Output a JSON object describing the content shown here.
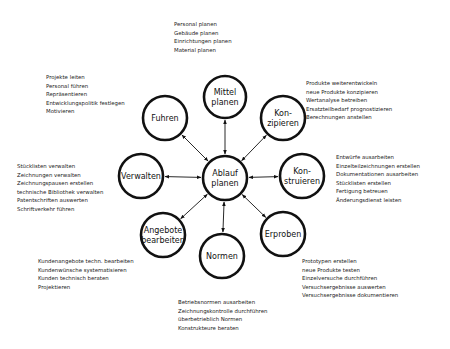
{
  "center": {
    "line1": "Ablauf",
    "line2": "planen",
    "x": 225,
    "y": 178,
    "r": 22
  },
  "nodes": [
    {
      "id": "mittel",
      "line1": "Mittel",
      "line2": "planen",
      "x": 225,
      "y": 97,
      "r": 21
    },
    {
      "id": "konzipieren",
      "line1": "Kon-",
      "line2": "zipieren",
      "x": 283,
      "y": 118,
      "r": 22
    },
    {
      "id": "konstruieren",
      "line1": "Kon-",
      "line2": "struieren",
      "x": 302,
      "y": 176,
      "r": 22
    },
    {
      "id": "erproben",
      "line1": "Erproben",
      "line2": "",
      "x": 283,
      "y": 234,
      "r": 22
    },
    {
      "id": "normen",
      "line1": "Normen",
      "line2": "",
      "x": 222,
      "y": 256,
      "r": 22
    },
    {
      "id": "angebote",
      "line1": "Angebote",
      "line2": "bearbeiten",
      "x": 163,
      "y": 235,
      "r": 22
    },
    {
      "id": "verwalten",
      "line1": "Verwalten",
      "line2": "",
      "x": 141,
      "y": 176,
      "r": 22
    },
    {
      "id": "fuhren",
      "line1": "Fuhren",
      "line2": "",
      "x": 165,
      "y": 118,
      "r": 22
    }
  ],
  "tasks": {
    "mittel": [
      "Personal planen",
      "Gebäude planen",
      "Einrichtungen planen",
      "Material planen"
    ],
    "fuhren": [
      "Projekte leiten",
      "Personal führen",
      "Repräsentieren",
      "Entwicklungspolitik festlegen",
      "Motivieren"
    ],
    "konzipieren": [
      "Produkte weiterentwickeln",
      "neue Produkte konzipieren",
      "Wertanalyse betreiben",
      "Ersatzteilbedarf prognostizieren",
      "Berechnungen anstellen"
    ],
    "verwalten": [
      "Stücklisten verwalten",
      "Zeichnungen verwalten",
      "Zeichnungspausen erstellen",
      "technische Bibliothek verwalten",
      "Patentschriften auswerten",
      "Schriftverkehr führen"
    ],
    "konstruieren": [
      "Entwürfe ausarbeiten",
      "Einzelteilzeichnungen erstellen",
      "Dokumentationen ausarbeiten",
      "Stücklisten erstellen",
      "Fertigung betreuen",
      "Änderungsdienst leisten"
    ],
    "angebote": [
      "Kundenangebote techn. bearbeiten",
      "Kundenwünsche systematisieren",
      "Kunden technisch beraten",
      "Projektieren"
    ],
    "erproben": [
      "Prototypen erstellen",
      "neue Produkte testen",
      "Einzelversuche durchführen",
      "Versuchsergebnisse auswerten",
      "Versuchsergebnisse dokumentieren"
    ],
    "normen": [
      "Betriebsnormen ausarbeiten",
      "Zeichnungskontrolle durchführen",
      "überbetrieblich Normen",
      "Konstrukteure beraten"
    ]
  }
}
